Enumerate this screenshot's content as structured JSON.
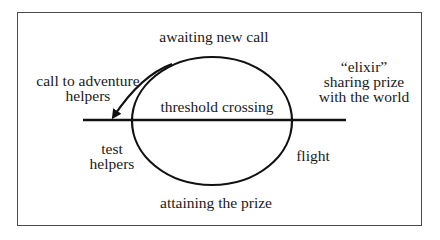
{
  "diagram": {
    "type": "hero-journey-cycle",
    "labels": {
      "top": "awaiting new call",
      "upper_left": [
        "call to adventure",
        "helpers"
      ],
      "center": "threshold crossing",
      "upper_right": [
        "“elixir”",
        "sharing prize",
        "with the world"
      ],
      "lower_left": [
        "test",
        "helpers"
      ],
      "lower_right": "flight",
      "bottom": "attaining the prize"
    },
    "shapes": {
      "ellipse": {
        "cx": 212,
        "cy": 121,
        "rx": 80,
        "ry": 64
      },
      "threshold_line": {
        "x1": 83,
        "x2": 346,
        "y": 120
      },
      "arrow": {
        "from": [
          172,
          64
        ],
        "to": [
          112,
          118
        ],
        "direction": "counterclockwise"
      }
    },
    "colors": {
      "stroke": "#111111",
      "frame": "#4a4a4a",
      "background": "#ffffff"
    }
  }
}
